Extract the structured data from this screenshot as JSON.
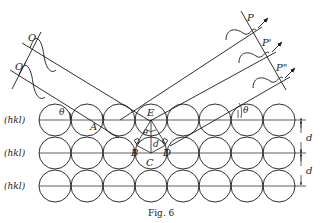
{
  "figure": {
    "caption": "Fig. 6"
  },
  "labels": {
    "plane_label": "(hkl)",
    "incident_wave_1": "O",
    "incident_wave_2": "O'",
    "diffracted_1": "P",
    "diffracted_2": "P'",
    "diffracted_3": "P\"",
    "point_a": "A",
    "point_b": "B",
    "point_c": "C",
    "point_d": "D",
    "point_e": "E",
    "theta": "θ",
    "spacing": "d"
  },
  "planes": [
    {
      "label": "(hkl)"
    },
    {
      "label": "(hkl)"
    },
    {
      "label": "(hkl)"
    }
  ],
  "colors": {
    "ink": "#1a1a1a",
    "background": "#ffffff"
  }
}
